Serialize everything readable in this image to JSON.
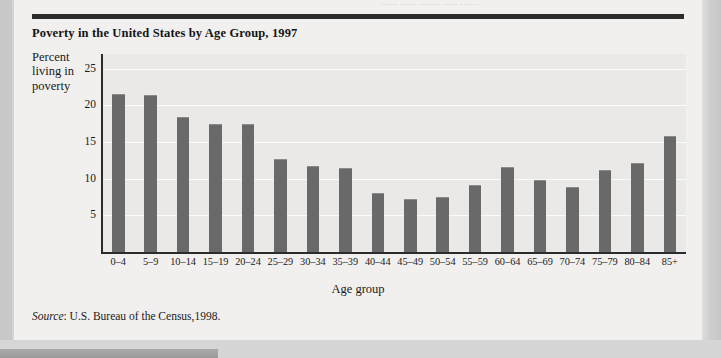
{
  "page": {
    "top_bleed_text": "······  ·····  ·······  ·····  ······",
    "bar_color": "#696969",
    "plot_bg_color": "#ebe9e7",
    "sheet_color": "#f1f0ee",
    "rule_color": "#2b2b2b"
  },
  "figure": {
    "title": "Poverty in the United States by Age Group, 1997",
    "source_prefix": "Source",
    "source_text": ": U.S. Bureau of the Census,1998."
  },
  "chart_data": {
    "type": "bar",
    "title": "Poverty in the United States by Age Group, 1997",
    "subtitle": "",
    "xlabel": "Age group",
    "ylabel": "Percent living in poverty",
    "ylabel_lines": [
      "Percent",
      "living in",
      "poverty"
    ],
    "categories": [
      "0–4",
      "5–9",
      "10–14",
      "15–19",
      "20–24",
      "25–29",
      "30–34",
      "35–39",
      "40–44",
      "45–49",
      "50–54",
      "55–59",
      "60–64",
      "65–69",
      "70–74",
      "75–79",
      "80–84",
      "85+"
    ],
    "values": [
      21.6,
      21.4,
      18.4,
      17.4,
      17.5,
      12.7,
      11.8,
      11.4,
      8.1,
      7.3,
      7.5,
      9.2,
      11.6,
      9.8,
      8.9,
      11.2,
      12.1,
      15.8
    ],
    "ylim": [
      0,
      27
    ],
    "yticks": [
      5,
      10,
      15,
      20,
      25
    ],
    "ytick_labels": [
      "5",
      "10",
      "15",
      "20",
      "25"
    ],
    "grid": true,
    "legend": false,
    "legend_position": "none",
    "series_color": "#696969",
    "source": "Source: U.S. Bureau of the Census,1998."
  }
}
